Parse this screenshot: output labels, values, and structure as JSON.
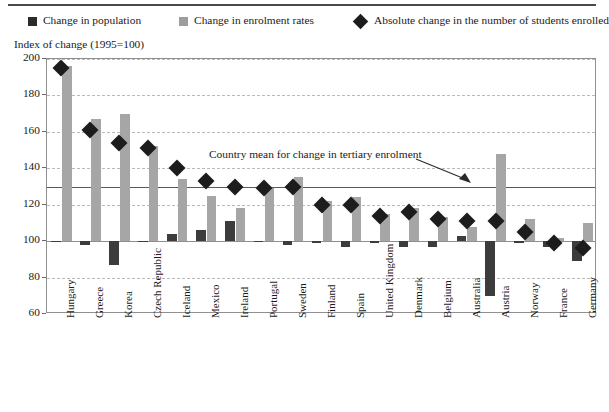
{
  "legend": {
    "items": [
      {
        "label": "Change in population",
        "swatch": "dark-square-icon",
        "color": "#2b2b2b"
      },
      {
        "label": "Change in enrolment rates",
        "swatch": "light-square-icon",
        "color": "#9d9d9d"
      },
      {
        "label": "Absolute change in the number of students enrolled",
        "swatch": "diamond-icon",
        "color": "#1c1c1c"
      }
    ]
  },
  "axis_title": "Index of change (1995=100)",
  "annotation": "Country mean for change in tertiary enrolment",
  "chart_data": {
    "type": "bar",
    "title": "",
    "subtitle": "",
    "xlabel": "",
    "ylabel": "Index of change (1995=100)",
    "ylim": [
      60,
      200
    ],
    "yticks": [
      60,
      80,
      100,
      120,
      140,
      160,
      180,
      200
    ],
    "ytick_labels": [
      "60",
      "80",
      "100",
      "120",
      "140",
      "160",
      "180",
      "200"
    ],
    "grid": true,
    "legend_position": "top",
    "baseline": 100,
    "reference_line": {
      "label": "Country mean for change in tertiary enrolment",
      "value": 130
    },
    "categories": [
      "Hungary",
      "Greece",
      "Korea",
      "Czech Republic",
      "Iceland",
      "Mexico",
      "Ireland",
      "Portugal",
      "Sweden",
      "Finland",
      "Spain",
      "United Kingdom",
      "Denmark",
      "Belgium",
      "Australia",
      "Austria",
      "Norway",
      "France",
      "Germany"
    ],
    "series": [
      {
        "name": "Change in population",
        "type": "bar",
        "color": "#3c3c3c",
        "values": [
          100,
          98,
          87,
          100,
          104,
          106,
          111,
          100,
          98,
          99,
          97,
          99,
          97,
          97,
          103,
          70,
          99,
          97,
          89
        ]
      },
      {
        "name": "Change in enrolment rates",
        "type": "bar",
        "color": "#a6a6a6",
        "values": [
          196,
          167,
          170,
          152,
          134,
          125,
          118,
          129,
          135,
          122,
          124,
          115,
          118,
          113,
          108,
          148,
          112,
          102,
          110
        ]
      },
      {
        "name": "Absolute change in the number of students enrolled",
        "type": "marker",
        "color": "#1c1c1c",
        "values": [
          195,
          161,
          154,
          151,
          140,
          133,
          130,
          129,
          130,
          120,
          120,
          114,
          116,
          112,
          111,
          111,
          105,
          99,
          96
        ]
      }
    ]
  }
}
